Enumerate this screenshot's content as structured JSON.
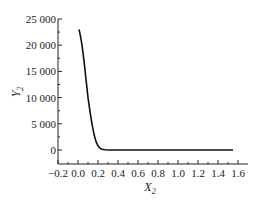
{
  "chart_data": {
    "type": "line",
    "title": "",
    "xlabel": "X",
    "xlabel_sub": "2",
    "ylabel": "Y",
    "ylabel_sub": "2",
    "xlim": [
      -0.2,
      1.6
    ],
    "ylim": [
      -2000,
      25000
    ],
    "xticks": [
      "-0.2",
      "0.0",
      "0.2",
      "0.4",
      "0.6",
      "0.8",
      "1.0",
      "1.2",
      "1.4",
      "1.6"
    ],
    "yticks": [
      "0",
      "5 000",
      "10 000",
      "15 000",
      "20 000",
      "25 000"
    ],
    "grid": false,
    "legend": null,
    "series": [
      {
        "name": "Y2",
        "color": "#111111",
        "x": [
          0.01,
          0.02,
          0.04,
          0.06,
          0.08,
          0.1,
          0.12,
          0.14,
          0.16,
          0.18,
          0.2,
          0.22,
          0.24,
          0.27,
          0.3,
          0.4,
          0.6,
          0.8,
          1.0,
          1.2,
          1.4,
          1.55
        ],
        "y": [
          23000,
          22200,
          20000,
          17000,
          13500,
          10000,
          7300,
          5000,
          3000,
          1600,
          800,
          350,
          150,
          40,
          0,
          0,
          0,
          0,
          0,
          0,
          0,
          0
        ]
      }
    ]
  }
}
